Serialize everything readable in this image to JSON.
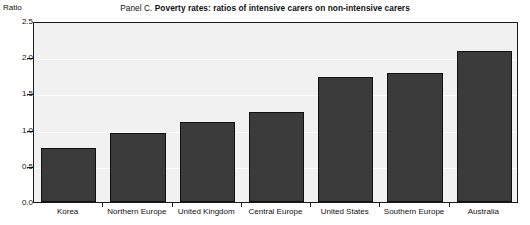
{
  "chart_data": {
    "type": "bar",
    "title": "Panel C. Poverty rates: ratios of intensive carers on non-intensive carers",
    "title_prefix": "Panel C.",
    "title_main": "Poverty rates: ratios of intensive carers on non-intensive carers",
    "categories": [
      "Korea",
      "Northern Europe",
      "United Kingdom",
      "Central Europe",
      "United States",
      "Southern Europe",
      "Australia"
    ],
    "values": [
      0.75,
      0.95,
      1.1,
      1.25,
      1.72,
      1.78,
      2.08
    ],
    "xlabel": "",
    "ylabel": "Ratio",
    "ylim": [
      0.0,
      2.5
    ],
    "ytick_labels": [
      "0.0",
      "0.5",
      "1.0",
      "1.5",
      "2.0",
      "2.5"
    ],
    "ytick_values": [
      0.0,
      0.5,
      1.0,
      1.5,
      2.0,
      2.5
    ],
    "grid": true,
    "legend": false,
    "bar_color": "#3b3b3b",
    "plot_background": "#f1f1f1",
    "frame_color": "#1a1a1a"
  }
}
